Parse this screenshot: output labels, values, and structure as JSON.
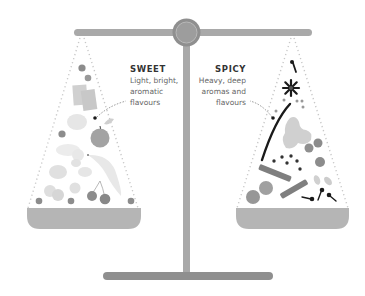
{
  "diagram": {
    "type": "balance-scale",
    "colors": {
      "beam": "#a9a9a9",
      "pivot_outer": "#8f8f8f",
      "pivot_inner": "#9a9a9a",
      "pan": "#b5b5b5",
      "dots": "#c8c8c8",
      "accent_dark": "#1a1a1a",
      "fruit_light": "#e2e2e2",
      "fruit_mid": "#bdbdbd",
      "fruit_dark": "#8c8c8c"
    },
    "left_pan": {
      "title": "SWEET",
      "description_lines": [
        "Light, bright,",
        "aromatic",
        "flavours"
      ],
      "items": [
        "berry",
        "berry",
        "wafer-slices",
        "apple",
        "leaf",
        "citrus-slices",
        "banana",
        "cherries",
        "berry",
        "berry",
        "berry"
      ]
    },
    "right_pan": {
      "title": "SPICY",
      "description_lines": [
        "Heavy, deep",
        "aromas and",
        "flavours"
      ],
      "items": [
        "clove",
        "star-anise",
        "peppercorns",
        "vanilla-pod",
        "ginger",
        "cinnamon-sticks",
        "nutmeg",
        "cardamom",
        "cloves"
      ]
    }
  }
}
